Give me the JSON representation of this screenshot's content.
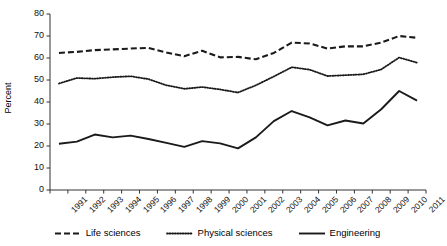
{
  "chart_data": {
    "type": "line",
    "title": "",
    "xlabel": "",
    "ylabel": "Percent",
    "ylim": [
      0,
      80
    ],
    "ytick_step": 10,
    "yticks": [
      "80",
      "70",
      "60",
      "50",
      "40",
      "30",
      "20",
      "10",
      "0"
    ],
    "grid": false,
    "legend_position": "bottom",
    "categories": [
      "1991",
      "1992",
      "1993",
      "1994",
      "1995",
      "1996",
      "1997",
      "1998",
      "1999",
      "2000",
      "2001",
      "2002",
      "2003",
      "2004",
      "2005",
      "2006",
      "2007",
      "2008",
      "2009",
      "2010",
      "2011"
    ],
    "series": [
      {
        "name": "Life sciences",
        "style": "dashed",
        "color": "#1a1a1a",
        "values": [
          62.3,
          62.8,
          63.6,
          63.9,
          64.3,
          64.6,
          62.5,
          60.8,
          63.3,
          60.3,
          60.5,
          59.4,
          62.3,
          67.0,
          66.6,
          64.3,
          65.3,
          65.3,
          67.0,
          70.0,
          69.2
        ]
      },
      {
        "name": "Physical sciences",
        "style": "dotted",
        "color": "#1a1a1a",
        "values": [
          48.4,
          50.9,
          50.6,
          51.3,
          51.7,
          50.4,
          47.6,
          46.0,
          46.8,
          45.7,
          44.3,
          47.6,
          51.6,
          55.8,
          54.7,
          51.8,
          52.2,
          52.6,
          54.8,
          60.2,
          57.9
        ]
      },
      {
        "name": "Engineering",
        "style": "solid",
        "color": "#1a1a1a",
        "values": [
          21.0,
          22.0,
          25.2,
          23.9,
          24.7,
          23.2,
          21.4,
          19.6,
          22.2,
          21.2,
          18.9,
          23.9,
          31.3,
          35.9,
          33.0,
          29.4,
          31.6,
          30.2,
          36.7,
          45.0,
          40.6
        ]
      }
    ]
  },
  "legend": {
    "items": [
      {
        "label": "Life sciences",
        "style": "dashed"
      },
      {
        "label": "Physical sciences",
        "style": "dotted"
      },
      {
        "label": "Engineering",
        "style": "solid"
      }
    ]
  }
}
